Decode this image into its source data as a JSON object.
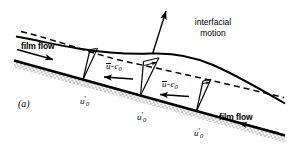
{
  "figure": {
    "panel_label": "(a)",
    "caption_labels": {
      "interfacial_motion_line1": "interfacial",
      "interfacial_motion_line2": "motion",
      "film_flow_left": "film flow",
      "film_flow_right": "film flow"
    },
    "velocity_labels": {
      "wall_velocity_1": {
        "symbol": "u",
        "prime": "'",
        "sub": "0"
      },
      "wall_velocity_2": {
        "symbol": "u",
        "prime": "'",
        "sub": "0"
      },
      "wall_velocity_3": {
        "symbol": "u",
        "prime": "'",
        "sub": "0"
      },
      "relative_velocity_1": {
        "bar_symbol": "u",
        "operator": "-",
        "symbol": "c",
        "sub": "0"
      },
      "relative_velocity_2": {
        "bar_symbol": "u",
        "operator": "-",
        "symbol": "c",
        "sub": "0"
      }
    },
    "colors": {
      "ink": "#000000",
      "background": "#ffffff",
      "wall_hatch": "#9a9a9a"
    },
    "elements": {
      "wall": "solid-hatched-inclined-wall",
      "interface": "solid-wavy-interface-curve",
      "mean_interface": "dashed-reference-line",
      "interfacial_motion_arrow": "long-arrow-up-right",
      "velocity_profiles": "three-thin-triangular-velocity-profiles",
      "relative_flow_arrows": "two-leftward-arrows",
      "film_flow_arrow_left": "rightward-arrow",
      "film_flow_arrow_right": "leftward-arrow"
    }
  }
}
